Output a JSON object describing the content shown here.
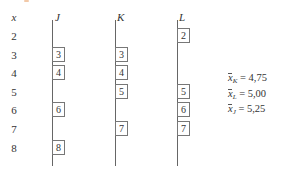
{
  "diagram": {
    "axis_label": "x",
    "rows": [
      2,
      3,
      4,
      5,
      6,
      7,
      8
    ],
    "columns": [
      {
        "name": "J",
        "values": [
          3,
          4,
          6,
          8
        ]
      },
      {
        "name": "K",
        "values": [
          3,
          4,
          5,
          7
        ]
      },
      {
        "name": "L",
        "values": [
          2,
          5,
          6,
          7
        ]
      }
    ],
    "stats": [
      {
        "symbol": "x",
        "subscript": "K",
        "eq": "= 4,75"
      },
      {
        "symbol": "x",
        "subscript": "L",
        "eq": "= 5,00"
      },
      {
        "symbol": "x",
        "subscript": "J",
        "eq": "= 5,25"
      }
    ]
  }
}
